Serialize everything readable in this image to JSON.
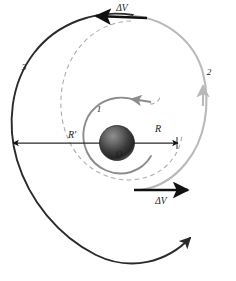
{
  "figure": {
    "background_color": "#ffffff"
  },
  "central_body": {
    "name_label": "O",
    "fill_dark": "#2b2b2b",
    "fill_light": "#9a9a9a",
    "radius_px": 17
  },
  "orbits": [
    {
      "id": "orbit-1",
      "label": "1",
      "description": "inner circular orbit of radius R",
      "color": "#8c8c8c",
      "style": "solid"
    },
    {
      "id": "orbit-2",
      "label": "2",
      "description": "outer arc segment",
      "color": "#b5b5b5",
      "style": "solid"
    },
    {
      "id": "orbit-3",
      "label": "3",
      "description": "outer spiral of radius R-prime",
      "color": "#2a2a2a",
      "style": "solid"
    },
    {
      "id": "transfer-ellipse",
      "label": "",
      "description": "dashed transfer trajectory",
      "color": "#adadad",
      "style": "dashed"
    }
  ],
  "radii": [
    {
      "id": "radius-R",
      "label": "R",
      "description": "inner orbit radius"
    },
    {
      "id": "radius-R-prime",
      "label": "R'",
      "description": "outer orbit radius"
    }
  ],
  "burns": [
    {
      "id": "delta-v-top",
      "label": "ΔV",
      "direction": "left",
      "color": "#111111"
    },
    {
      "id": "delta-v-bottom",
      "label": "ΔV",
      "direction": "right",
      "color": "#111111"
    }
  ],
  "colors": {
    "dark": "#2a2a2a",
    "mid_gray": "#8c8c8c",
    "light_gray": "#b5b5b5",
    "dashed_gray": "#adadad",
    "black": "#111111"
  }
}
